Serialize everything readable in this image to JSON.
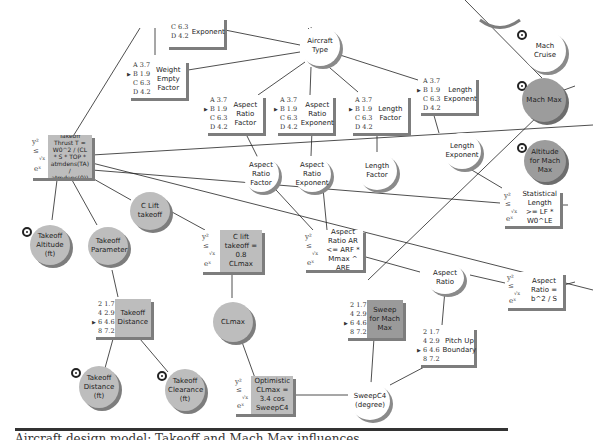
{
  "diagram": {
    "type": "influence-diagram",
    "caption": "Aircraft design model: Takeoff and Mach Max influences"
  },
  "legend_colors": {
    "decision_node": "#ffffff",
    "chance_node": "#bdbdbd",
    "objective_node": "#9c9c9c",
    "wire": "#222222"
  },
  "circles": [
    {
      "id": "aircraft_type",
      "label": "Aircraft Type",
      "style": "light"
    },
    {
      "id": "mach_cruise",
      "label": "Mach Cruise",
      "style": "light",
      "target": true
    },
    {
      "id": "mach_max",
      "label": "Mach Max",
      "style": "dark",
      "target": true
    },
    {
      "id": "altitude_mach_max",
      "label": "Altitude for Mach Max",
      "style": "dark",
      "target": true
    },
    {
      "id": "aspect_ratio_factor_c",
      "label": "Aspect Ratio Factor",
      "style": "light"
    },
    {
      "id": "aspect_ratio_exponent_c",
      "label": "Aspect Ratio Exponent",
      "style": "light"
    },
    {
      "id": "length_factor_c",
      "label": "Length Factor",
      "style": "light"
    },
    {
      "id": "length_exponent_c",
      "label": "Length Exponent",
      "style": "light"
    },
    {
      "id": "takeoff_altitude",
      "label": "Takeoff Altitude (ft)",
      "style": "gray",
      "target": true
    },
    {
      "id": "takeoff_parameter",
      "label": "Takeoff Parameter",
      "style": "gray"
    },
    {
      "id": "c_lift_takeoff",
      "label": "C Lift takeoff",
      "style": "gray"
    },
    {
      "id": "clmax",
      "label": "CLmax",
      "style": "gray"
    },
    {
      "id": "aspect_ratio",
      "label": "Aspect Ratio",
      "style": "light"
    },
    {
      "id": "sweep_c4",
      "label": "SweepC4 (degree)",
      "style": "light"
    },
    {
      "id": "takeoff_distance_ft",
      "label": "Takeoff Distance (ft)",
      "style": "gray",
      "target": true
    },
    {
      "id": "takeoff_clearance",
      "label": "Takeoff Clearance (ft)",
      "style": "gray",
      "target": true
    }
  ],
  "tables": [
    {
      "id": "exponent_top",
      "label": "Exponent",
      "options": [
        "C 6.3",
        "D 4.2"
      ],
      "selected": -1
    },
    {
      "id": "weight_empty_factor",
      "label": "Weight Empty Factor",
      "options": [
        "A 3.7",
        "B 1.9",
        "C 6.3",
        "D 4.2"
      ],
      "selected": 1
    },
    {
      "id": "aspect_ratio_factor_t",
      "label": "Aspect Ratio Factor",
      "options": [
        "A 3.7",
        "B 1.9",
        "C 6.3",
        "D 4.2"
      ],
      "selected": 1
    },
    {
      "id": "aspect_ratio_exponent_t",
      "label": "Aspect Ratio Exponent",
      "options": [
        "A 3.7",
        "B 1.9",
        "C 6.3",
        "D 4.2"
      ],
      "selected": 1
    },
    {
      "id": "length_factor_t",
      "label": "Length Factor",
      "options": [
        "A 3.7",
        "B 1.9",
        "C 6.3",
        "D 4.2"
      ],
      "selected": 1
    },
    {
      "id": "length_exponent_t",
      "label": "Length Exponent",
      "options": [
        "A 3.7",
        "B 1.9",
        "C 6.3",
        "D 4.2"
      ],
      "selected": 1
    },
    {
      "id": "takeoff_distance_t",
      "label": "Takeoff Distance",
      "options": [
        "2 1.7",
        "4 2.9",
        "6 4.6",
        "8 7.2"
      ],
      "selected": 2,
      "style": "gray"
    },
    {
      "id": "sweep_mach_max",
      "label": "Sweep for Mach Max",
      "options": [
        "2 1.7",
        "4 2.9",
        "6 4.6",
        "8 7.2"
      ],
      "selected": 2,
      "style": "dark"
    },
    {
      "id": "pitch_up_boundary",
      "label": "Pitch Up Boundary",
      "options": [
        "2 1.7",
        "4 2.9",
        "6 4.6",
        "8 7.2"
      ],
      "selected": 2
    }
  ],
  "formulas": [
    {
      "id": "takeoff_thrust",
      "label": "Takeoff Thrust T = W0^2 / (CL * S * TOP * atmdens(TA) / atmdens(0))",
      "style": "gray"
    },
    {
      "id": "c_lift_takeoff_f",
      "label": "C lift takeoff = 0.8 CLmax",
      "style": "gray"
    },
    {
      "id": "aspect_ratio_constraint",
      "label": "Aspect Ratio AR <= ARF * Mmax ^ ARE"
    },
    {
      "id": "statistical_length",
      "label": "Statistical Length >= LF * W0^LE"
    },
    {
      "id": "aspect_ratio_def",
      "label": "Aspect Ratio = b^2 / S"
    },
    {
      "id": "optimistic_clmax",
      "label": "Optimistic CLmax = 3.4 cos SweepC4",
      "style": "gray"
    }
  ],
  "fx_glyph": {
    "top": "y²",
    "mid": "≤",
    "root": "√x",
    "bottom": "eˣ"
  }
}
